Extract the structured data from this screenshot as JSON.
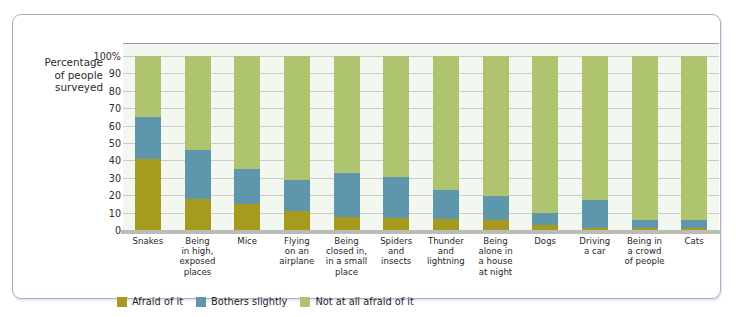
{
  "chart_data": {
    "type": "bar",
    "subtype": "stacked-bar-100-percent",
    "title": "",
    "xlabel": "",
    "ylabel": "Percentage of people surveyed",
    "ylim": [
      0,
      100
    ],
    "ytick_labels": [
      "100%",
      "90",
      "80",
      "70",
      "60",
      "50",
      "40",
      "30",
      "20",
      "10",
      "0"
    ],
    "ytick_values": [
      100,
      90,
      80,
      70,
      60,
      50,
      40,
      30,
      20,
      10,
      0
    ],
    "grid": true,
    "legend_position": "bottom-left",
    "categories": [
      "Snakes",
      "Being in high, exposed places",
      "Mice",
      "Flying on an airplane",
      "Being closed in, in a small place",
      "Spiders and insects",
      "Thunder and lightning",
      "Being alone in a house at night",
      "Dogs",
      "Driving a car",
      "Being in a crowd of people",
      "Cats"
    ],
    "category_lines": [
      [
        "Snakes"
      ],
      [
        "Being",
        "in high,",
        "exposed",
        "places"
      ],
      [
        "Mice"
      ],
      [
        "Flying",
        "on an",
        "airplane"
      ],
      [
        "Being",
        "closed in,",
        "in a small",
        "place"
      ],
      [
        "Spiders",
        "and",
        "insects"
      ],
      [
        "Thunder",
        "and",
        "lightning"
      ],
      [
        "Being",
        "alone in",
        "a house",
        "at night"
      ],
      [
        "Dogs"
      ],
      [
        "Driving",
        "a car"
      ],
      [
        "Being in",
        "a crowd",
        "of people"
      ],
      [
        "Cats"
      ]
    ],
    "series": [
      {
        "name": "Afraid of it",
        "color": "#a69a1f",
        "values": [
          41,
          18,
          15,
          11,
          7.5,
          7,
          6.5,
          5.5,
          3,
          1,
          1,
          1
        ]
      },
      {
        "name": "Bothers slightly",
        "color": "#5e97ab",
        "values": [
          24,
          28,
          20,
          18,
          25,
          23.5,
          16.5,
          14,
          7,
          16,
          5,
          4.5
        ]
      },
      {
        "name": "Not at all afraid of it",
        "color": "#aec46f",
        "values": [
          35,
          54,
          65,
          71,
          67.5,
          69.5,
          77,
          80.5,
          90,
          83,
          94,
          94.5
        ]
      }
    ],
    "cumulative_tops": {
      "afraid_of_it": [
        41,
        18,
        15,
        11,
        7.5,
        7,
        6.5,
        5.5,
        3,
        1,
        1,
        1
      ],
      "through_bothers_slightly": [
        65,
        46,
        35,
        29,
        32.5,
        30.5,
        23,
        19.5,
        10,
        17,
        6,
        5.5
      ],
      "total": [
        100,
        100,
        100,
        100,
        100,
        100,
        100,
        100,
        100,
        100,
        100,
        100
      ]
    }
  },
  "axis": {
    "y_title_lines": [
      "Percentage",
      "of people",
      "surveyed"
    ]
  },
  "legend": {
    "items": [
      {
        "label": "Afraid of it",
        "color": "#a69a1f"
      },
      {
        "label": "Bothers slightly",
        "color": "#5e97ab"
      },
      {
        "label": "Not at all afraid of it",
        "color": "#aec46f"
      }
    ]
  },
  "colors": {
    "afraid": "#a69a1f",
    "bothers": "#5e97ab",
    "not_afraid": "#aec46f",
    "plot_background": "#f2f7f0",
    "gridline": "#c9cfc7",
    "frame_border": "#a9aecb"
  }
}
